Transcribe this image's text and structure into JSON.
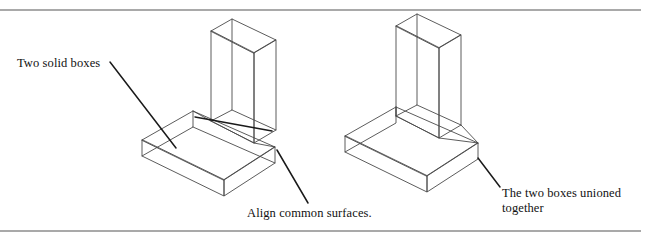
{
  "page": {
    "width": 650,
    "height": 241,
    "background": "#ffffff",
    "line_color": "#4a4a4a",
    "leader_color": "#1a1a1a",
    "rule_color": "#8c8c8c",
    "text_color": "#111111"
  },
  "rules": {
    "top": {
      "y": 10,
      "x1": 0,
      "x2": 641
    },
    "bottom": {
      "y": 231,
      "x1": 0,
      "x2": 641
    }
  },
  "labels": {
    "two_solid_boxes": "Two solid boxes",
    "align_common_surfaces": "Align common surfaces.",
    "two_boxes_unioned": "The two boxes unioned\ntogether"
  },
  "figures": [
    {
      "name": "two-solid-boxes-figure",
      "caption": "Two solid boxes",
      "description": "Isometric wireframe of a horizontal slab and a vertical slab shown as two separate overlapping boxes"
    },
    {
      "name": "unioned-boxes-figure",
      "caption": "The two boxes unioned together",
      "description": "Isometric wireframe of the same two slabs merged into a single L-shaped solid"
    }
  ],
  "geometry": {
    "left_horizontal_slab": {
      "top_face": "142,140 193,111 275,147 224,180",
      "front_left_face": "142,140 142,156 224,196 224,180",
      "front_right_face": "224,180 224,196 275,163 275,147",
      "hidden_back": "193,111 193,127 142,156"
    },
    "left_vertical_slab": {
      "top_face": "211,31 232,19 276,40 254,53",
      "left_face": "211,31 211,121 254,143 254,53",
      "right_face": "254,53 254,143 276,130 276,40",
      "hidden_back": "232,19 232,110 211,121"
    },
    "right_union_solid": {
      "base_top": "345,136 396,107 478,143 427,176",
      "base_front_left": "345,136 345,152 427,192 427,176",
      "base_front_right": "427,176 427,192 478,159 478,143",
      "upright_top": "396,26 417,14 461,35 439,48",
      "upright_left": "396,26 396,116 439,138 439,48",
      "upright_right": "439,48 439,138 478,143 478,35",
      "hidden_base_back": "396,107 396,123 345,152"
    }
  },
  "leaders": [
    {
      "name": "leader-two-solid-boxes-to-base",
      "path": "110,62 176,148"
    },
    {
      "name": "leader-two-solid-boxes-to-upright",
      "path": "195,117 272,131"
    },
    {
      "name": "leader-align-common-surfaces",
      "path": "277,150 308,203"
    },
    {
      "name": "leader-two-boxes-unioned",
      "path": "478,158 500,187"
    }
  ]
}
